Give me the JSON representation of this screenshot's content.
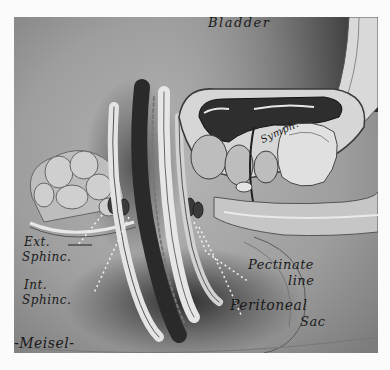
{
  "illustration": {
    "subject": "Sagittal section of pelvis showing rectum, anal canal and bladder",
    "labels": {
      "bladder": "Bladder",
      "symphysis": "Symph.",
      "ext_sphinc_1": "Ext.",
      "ext_sphinc_2": "Sphinc.",
      "int_sphinc_1": "Int.",
      "int_sphinc_2": "Sphinc.",
      "pectinate_1": "Pectinate",
      "pectinate_2": "line",
      "peritoneal_1": "Peritoneal",
      "peritoneal_2": "Sac"
    },
    "signature": "-Meisel-",
    "colors": {
      "background": "#fbfbfb",
      "midtone": "#9a9a9a",
      "dark": "#2a2a2a",
      "light": "#e6e6e6"
    }
  }
}
